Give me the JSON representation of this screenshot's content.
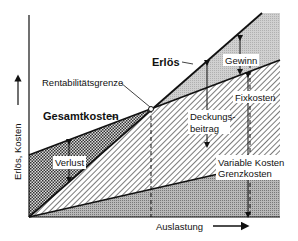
{
  "diagram": {
    "axes": {
      "y_label": "Erlös, Kosten",
      "x_label": "Auslastung"
    },
    "lines": {
      "revenue": "Erlös",
      "total_cost": "Gesamtkosten"
    },
    "annotations": {
      "break_even": "Rentabilitätsgrenze",
      "profit": "Gewinn",
      "contribution_line1": "Deckungs-",
      "contribution_line2": "beitrag",
      "fixed_costs": "Fixkosten",
      "loss": "Verlust",
      "variable_costs_line1": "Variable Kosten",
      "variable_costs_line2": "Grenzkosten"
    },
    "colors": {
      "line": "#1a1a1a",
      "profit_fill": "#c8c8c8",
      "variable_fill": "#a8a8a8",
      "background": "#ffffff"
    }
  }
}
